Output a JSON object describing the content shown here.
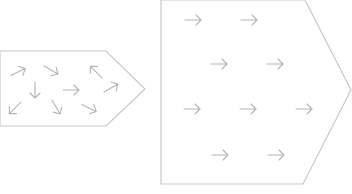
{
  "diagram": {
    "colors": {
      "outline": "#c8c8c8",
      "arrow": "#b4b4b4",
      "background": "#ffffff"
    },
    "left_shape": {
      "label": "disordered",
      "points": "0,51 106,51 145,89 106,126 0,126",
      "arrows": [
        {
          "x": 18,
          "y": 72,
          "angle": -25
        },
        {
          "x": 51,
          "y": 70,
          "angle": 30
        },
        {
          "x": 96,
          "y": 72,
          "angle": -135
        },
        {
          "x": 35,
          "y": 90,
          "angle": 90
        },
        {
          "x": 71,
          "y": 90,
          "angle": 0
        },
        {
          "x": 111,
          "y": 88,
          "angle": -30
        },
        {
          "x": 15,
          "y": 108,
          "angle": 135
        },
        {
          "x": 56,
          "y": 107,
          "angle": 60
        },
        {
          "x": 89,
          "y": 108,
          "angle": 25
        }
      ]
    },
    "right_shape": {
      "label": "aligned",
      "points": "161,0 305,0 351,90 303,184 161,184",
      "arrows": [
        {
          "x": 193,
          "y": 20,
          "angle": 0
        },
        {
          "x": 249,
          "y": 20,
          "angle": 0
        },
        {
          "x": 219,
          "y": 64,
          "angle": 0
        },
        {
          "x": 275,
          "y": 64,
          "angle": 0
        },
        {
          "x": 192,
          "y": 109,
          "angle": 0
        },
        {
          "x": 248,
          "y": 109,
          "angle": 0
        },
        {
          "x": 304,
          "y": 109,
          "angle": 0
        },
        {
          "x": 220,
          "y": 155,
          "angle": 0
        },
        {
          "x": 276,
          "y": 155,
          "angle": 0
        }
      ]
    }
  }
}
